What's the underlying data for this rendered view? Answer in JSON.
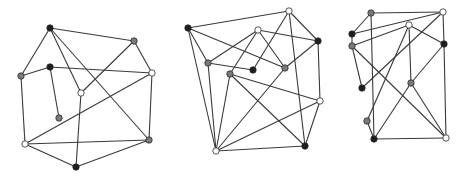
{
  "figure": {
    "width": 468,
    "height": 178,
    "colors": {
      "black": "#1e1e1e",
      "gray": "#7a7a7a",
      "white": "#ffffff",
      "edge": "#3a3a3a"
    },
    "graphs": [
      {
        "id": "graph-1",
        "nodes": [
          {
            "id": "a",
            "x": 50,
            "y": 28,
            "color": "black"
          },
          {
            "id": "b",
            "x": 134,
            "y": 41,
            "color": "gray"
          },
          {
            "id": "c",
            "x": 21,
            "y": 76,
            "color": "gray"
          },
          {
            "id": "d",
            "x": 50,
            "y": 67,
            "color": "black"
          },
          {
            "id": "e",
            "x": 152,
            "y": 73,
            "color": "white"
          },
          {
            "id": "f",
            "x": 81,
            "y": 93,
            "color": "white"
          },
          {
            "id": "g",
            "x": 59,
            "y": 118,
            "color": "gray"
          },
          {
            "id": "h",
            "x": 25,
            "y": 144,
            "color": "white"
          },
          {
            "id": "i",
            "x": 149,
            "y": 140,
            "color": "gray"
          },
          {
            "id": "j",
            "x": 76,
            "y": 167,
            "color": "black"
          }
        ],
        "edges": [
          [
            "a",
            "b"
          ],
          [
            "a",
            "c"
          ],
          [
            "a",
            "f"
          ],
          [
            "a",
            "i"
          ],
          [
            "c",
            "d"
          ],
          [
            "d",
            "e"
          ],
          [
            "d",
            "g"
          ],
          [
            "b",
            "e"
          ],
          [
            "b",
            "f"
          ],
          [
            "e",
            "h"
          ],
          [
            "e",
            "i"
          ],
          [
            "c",
            "h"
          ],
          [
            "f",
            "j"
          ],
          [
            "h",
            "i"
          ],
          [
            "h",
            "j"
          ],
          [
            "j",
            "i"
          ]
        ]
      },
      {
        "id": "graph-2",
        "nodes": [
          {
            "id": "a",
            "x": 188,
            "y": 28,
            "color": "black"
          },
          {
            "id": "b",
            "x": 289,
            "y": 11,
            "color": "white"
          },
          {
            "id": "c",
            "x": 258,
            "y": 30,
            "color": "white"
          },
          {
            "id": "d",
            "x": 318,
            "y": 41,
            "color": "black"
          },
          {
            "id": "e",
            "x": 208,
            "y": 63,
            "color": "gray"
          },
          {
            "id": "f",
            "x": 253,
            "y": 70,
            "color": "black"
          },
          {
            "id": "g",
            "x": 285,
            "y": 68,
            "color": "gray"
          },
          {
            "id": "h",
            "x": 230,
            "y": 74,
            "color": "gray"
          },
          {
            "id": "i",
            "x": 320,
            "y": 101,
            "color": "white"
          },
          {
            "id": "j",
            "x": 305,
            "y": 146,
            "color": "black"
          },
          {
            "id": "k",
            "x": 216,
            "y": 151,
            "color": "white"
          }
        ],
        "edges": [
          [
            "a",
            "b"
          ],
          [
            "a",
            "g"
          ],
          [
            "a",
            "e"
          ],
          [
            "a",
            "k"
          ],
          [
            "c",
            "e"
          ],
          [
            "c",
            "d"
          ],
          [
            "c",
            "g"
          ],
          [
            "c",
            "h"
          ],
          [
            "b",
            "f"
          ],
          [
            "b",
            "d"
          ],
          [
            "b",
            "j"
          ],
          [
            "e",
            "f"
          ],
          [
            "e",
            "k"
          ],
          [
            "g",
            "d"
          ],
          [
            "g",
            "k"
          ],
          [
            "h",
            "i"
          ],
          [
            "h",
            "j"
          ],
          [
            "h",
            "k"
          ],
          [
            "d",
            "i"
          ],
          [
            "i",
            "j"
          ],
          [
            "i",
            "k"
          ],
          [
            "k",
            "j"
          ]
        ]
      },
      {
        "id": "graph-3",
        "nodes": [
          {
            "id": "a",
            "x": 371,
            "y": 13,
            "color": "gray"
          },
          {
            "id": "b",
            "x": 443,
            "y": 12,
            "color": "white"
          },
          {
            "id": "c",
            "x": 352,
            "y": 34,
            "color": "black"
          },
          {
            "id": "d",
            "x": 409,
            "y": 25,
            "color": "white"
          },
          {
            "id": "e",
            "x": 352,
            "y": 46,
            "color": "gray"
          },
          {
            "id": "f",
            "x": 444,
            "y": 44,
            "color": "black"
          },
          {
            "id": "g",
            "x": 362,
            "y": 88,
            "color": "black"
          },
          {
            "id": "h",
            "x": 411,
            "y": 83,
            "color": "gray"
          },
          {
            "id": "i",
            "x": 367,
            "y": 121,
            "color": "gray"
          },
          {
            "id": "j",
            "x": 374,
            "y": 139,
            "color": "black"
          },
          {
            "id": "k",
            "x": 446,
            "y": 138,
            "color": "white"
          }
        ],
        "edges": [
          [
            "a",
            "b"
          ],
          [
            "a",
            "c"
          ],
          [
            "a",
            "j"
          ],
          [
            "b",
            "c"
          ],
          [
            "b",
            "f"
          ],
          [
            "b",
            "g"
          ],
          [
            "c",
            "e"
          ],
          [
            "e",
            "d"
          ],
          [
            "e",
            "g"
          ],
          [
            "e",
            "k"
          ],
          [
            "d",
            "f"
          ],
          [
            "d",
            "h"
          ],
          [
            "d",
            "i"
          ],
          [
            "f",
            "h"
          ],
          [
            "f",
            "k"
          ],
          [
            "h",
            "j"
          ],
          [
            "h",
            "k"
          ],
          [
            "j",
            "k"
          ],
          [
            "j",
            "i"
          ]
        ]
      }
    ]
  }
}
